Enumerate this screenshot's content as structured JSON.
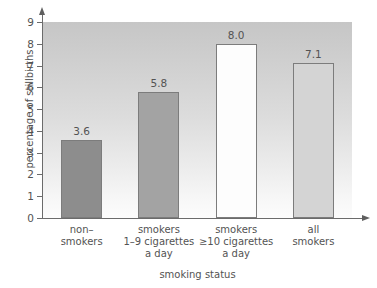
{
  "chart_data": {
    "type": "bar",
    "title": "",
    "cut_off_title": "",
    "categories": [
      "non–\nsmokers",
      "smokers\n1–9 cigarettes\na day",
      "smokers\n≥10 cigarettes\na day",
      "all\nsmokers"
    ],
    "category_lines": [
      [
        "non–",
        "smokers"
      ],
      [
        "smokers",
        "1–9 cigarettes",
        "a day"
      ],
      [
        "smokers",
        "≥10 cigarettes",
        "a day"
      ],
      [
        "all",
        "smokers"
      ]
    ],
    "values": [
      3.6,
      5.8,
      8.0,
      7.1
    ],
    "value_labels": [
      "3.6",
      "5.8",
      "8.0",
      "7.1"
    ],
    "bar_colors": [
      "#8d8d8d",
      "#a3a3a3",
      "#fdfdfd",
      "#d4d4d4"
    ],
    "bar_border_color": "#7c7c7c",
    "xlabel": "smoking status",
    "ylabel": "percentage of stillbirths",
    "ylim": [
      0,
      9
    ],
    "ytick_labels": [
      "0",
      "1",
      "2",
      "3",
      "4",
      "5",
      "6",
      "7",
      "8",
      "9"
    ],
    "ytick_values": [
      0,
      1,
      2,
      3,
      4,
      5,
      6,
      7,
      8,
      9
    ],
    "grid": false,
    "legend": null,
    "plot_background": "gradient-gray-to-white",
    "axis_color": "#6b6b6b",
    "text_color": "#535353"
  }
}
